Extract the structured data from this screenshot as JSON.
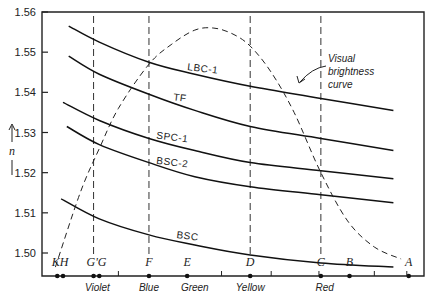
{
  "chart_data": {
    "type": "line",
    "title": "",
    "xlabel": "",
    "ylabel": "n",
    "ylim": [
      1.495,
      1.56
    ],
    "xlim": [
      0,
      1
    ],
    "grid": false,
    "yticks": [
      1.5,
      1.51,
      1.52,
      1.53,
      1.54,
      1.55,
      1.56
    ],
    "ytick_labels": [
      "1.50",
      "1.51",
      "1.52",
      "1.53",
      "1.54",
      "1.55",
      "1.56"
    ],
    "fraunhofer_lines": [
      {
        "label": "K",
        "x": 0.04
      },
      {
        "label": "H",
        "x": 0.055
      },
      {
        "label": "G'",
        "x": 0.135
      },
      {
        "label": "G",
        "x": 0.15
      },
      {
        "label": "F",
        "x": 0.28
      },
      {
        "label": "E",
        "x": 0.38
      },
      {
        "label": "D",
        "x": 0.545
      },
      {
        "label": "C",
        "x": 0.73
      },
      {
        "label": "B",
        "x": 0.805
      },
      {
        "label": "A",
        "x": 0.96
      }
    ],
    "dashed_verticals": [
      "G'",
      "F",
      "D",
      "C"
    ],
    "color_bands": [
      {
        "label": "Violet",
        "x": 0.145
      },
      {
        "label": "Blue",
        "x": 0.28
      },
      {
        "label": "Green",
        "x": 0.4
      },
      {
        "label": "Yellow",
        "x": 0.545
      },
      {
        "label": "Red",
        "x": 0.74
      }
    ],
    "series": [
      {
        "name": "LBC-1",
        "x": [
          0.07,
          0.15,
          0.28,
          0.4,
          0.545,
          0.73,
          0.92
        ],
        "values": [
          1.5565,
          1.5525,
          1.5475,
          1.5445,
          1.5415,
          1.5385,
          1.5355
        ]
      },
      {
        "name": "TF",
        "x": [
          0.07,
          0.15,
          0.28,
          0.4,
          0.545,
          0.73,
          0.92
        ],
        "values": [
          1.549,
          1.5445,
          1.5395,
          1.5355,
          1.5315,
          1.5285,
          1.5255
        ]
      },
      {
        "name": "SPC-1",
        "x": [
          0.055,
          0.15,
          0.28,
          0.4,
          0.545,
          0.73,
          0.92
        ],
        "values": [
          1.5375,
          1.533,
          1.5285,
          1.5255,
          1.5225,
          1.5205,
          1.5185
        ]
      },
      {
        "name": "BSC-2",
        "x": [
          0.065,
          0.15,
          0.28,
          0.4,
          0.545,
          0.73,
          0.92
        ],
        "values": [
          1.5315,
          1.527,
          1.5225,
          1.519,
          1.5165,
          1.5145,
          1.5125
        ]
      },
      {
        "name": "BSC",
        "x": [
          0.05,
          0.15,
          0.28,
          0.4,
          0.545,
          0.73,
          0.92
        ],
        "values": [
          1.5135,
          1.5085,
          1.5045,
          1.502,
          1.4995,
          1.4975,
          1.4965
        ]
      }
    ],
    "brightness_curve": {
      "name": "Visual brightness curve",
      "style": "dashed",
      "x": [
        0.035,
        0.1,
        0.15,
        0.2,
        0.28,
        0.34,
        0.4,
        0.45,
        0.5,
        0.545,
        0.6,
        0.66,
        0.73,
        0.8,
        0.87,
        0.94
      ],
      "values": [
        1.4965,
        1.515,
        1.526,
        1.536,
        1.547,
        1.552,
        1.5555,
        1.556,
        1.5545,
        1.5515,
        1.545,
        1.535,
        1.52,
        1.508,
        1.5015,
        1.4985
      ]
    },
    "annotations": [
      {
        "text_lines": [
          "Visual",
          "brightness",
          "curve"
        ],
        "points_to": "brightness_curve"
      }
    ]
  }
}
